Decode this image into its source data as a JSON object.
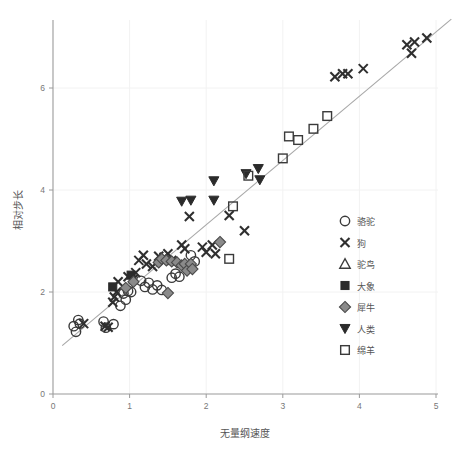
{
  "chart_data": {
    "type": "scatter",
    "title": "",
    "xlabel": "无量纲速度",
    "ylabel": "相对步长",
    "xlim": [
      -0.05,
      5.3
    ],
    "ylim": [
      0,
      7.4
    ],
    "xticks": [
      0,
      1,
      2,
      3,
      4,
      5
    ],
    "yticks": [
      0,
      2,
      4,
      6
    ],
    "xtick_labels": [
      "0",
      "1",
      "2",
      "3",
      "4",
      "5"
    ],
    "ytick_labels": [
      "0",
      "2",
      "4",
      "6"
    ],
    "grid": true,
    "legend_position": "right-center",
    "trendline": {
      "name": "拟合直线",
      "x": [
        0.12,
        5.2
      ],
      "y": [
        0.95,
        7.35
      ]
    },
    "series": [
      {
        "name": "骆驼",
        "marker": "circle-open",
        "color": "#3a3a3a",
        "points": [
          [
            0.27,
            1.33
          ],
          [
            0.3,
            1.22
          ],
          [
            0.33,
            1.45
          ],
          [
            0.35,
            1.38
          ],
          [
            0.66,
            1.42
          ],
          [
            0.69,
            1.3
          ],
          [
            0.79,
            1.37
          ],
          [
            0.88,
            1.73
          ],
          [
            0.92,
            1.97
          ],
          [
            0.95,
            1.85
          ],
          [
            0.98,
            2.02
          ],
          [
            1.02,
            2.0
          ],
          [
            1.15,
            2.22
          ],
          [
            1.2,
            2.1
          ],
          [
            1.25,
            2.18
          ],
          [
            1.3,
            2.05
          ],
          [
            1.36,
            2.13
          ],
          [
            1.42,
            2.04
          ],
          [
            1.55,
            2.28
          ],
          [
            1.6,
            2.36
          ],
          [
            1.65,
            2.3
          ],
          [
            1.8,
            2.72
          ],
          [
            1.85,
            2.6
          ]
        ]
      },
      {
        "name": "狗",
        "marker": "cross",
        "color": "#2f2f2f",
        "points": [
          [
            0.4,
            1.38
          ],
          [
            0.68,
            1.33
          ],
          [
            0.72,
            1.31
          ],
          [
            0.78,
            1.8
          ],
          [
            0.8,
            1.9
          ],
          [
            0.83,
            2.0
          ],
          [
            0.85,
            2.2
          ],
          [
            0.98,
            2.3
          ],
          [
            1.05,
            2.25
          ],
          [
            1.08,
            2.38
          ],
          [
            1.12,
            2.62
          ],
          [
            1.18,
            2.72
          ],
          [
            1.22,
            2.55
          ],
          [
            1.3,
            2.5
          ],
          [
            1.38,
            2.7
          ],
          [
            1.45,
            2.68
          ],
          [
            1.5,
            2.75
          ],
          [
            1.55,
            2.62
          ],
          [
            1.68,
            2.92
          ],
          [
            1.72,
            2.85
          ],
          [
            1.78,
            3.48
          ],
          [
            1.95,
            2.88
          ],
          [
            2.0,
            2.78
          ],
          [
            2.08,
            2.92
          ],
          [
            2.12,
            2.75
          ],
          [
            2.3,
            3.5
          ],
          [
            2.5,
            3.2
          ],
          [
            3.68,
            6.22
          ],
          [
            3.78,
            6.28
          ],
          [
            3.85,
            6.28
          ],
          [
            4.05,
            6.38
          ],
          [
            4.62,
            6.85
          ],
          [
            4.68,
            6.68
          ],
          [
            4.72,
            6.9
          ],
          [
            4.88,
            6.98
          ]
        ]
      },
      {
        "name": "驼鸟",
        "marker": "triangle-open",
        "color": "#3a3a3a",
        "points": []
      },
      {
        "name": "大象",
        "marker": "square-filled",
        "color": "#2b2b2b",
        "points": [
          [
            0.78,
            2.1
          ],
          [
            1.02,
            2.33
          ]
        ]
      },
      {
        "name": "犀牛",
        "marker": "diamond-filled",
        "color": "#8a8a8a",
        "points": [
          [
            0.95,
            2.08
          ],
          [
            1.05,
            2.2
          ],
          [
            1.38,
            2.58
          ],
          [
            1.42,
            2.65
          ],
          [
            1.48,
            2.62
          ],
          [
            1.5,
            1.98
          ],
          [
            1.55,
            2.6
          ],
          [
            1.62,
            2.58
          ],
          [
            1.68,
            2.52
          ],
          [
            1.72,
            2.55
          ],
          [
            1.75,
            2.42
          ],
          [
            1.8,
            2.55
          ],
          [
            1.82,
            2.45
          ],
          [
            2.18,
            2.98
          ]
        ]
      },
      {
        "name": "人类",
        "marker": "triangle-down-filled",
        "color": "#2b2b2b",
        "points": [
          [
            1.68,
            3.78
          ],
          [
            1.8,
            3.8
          ],
          [
            2.1,
            4.18
          ],
          [
            2.1,
            3.8
          ],
          [
            2.52,
            4.32
          ],
          [
            2.68,
            4.42
          ],
          [
            2.7,
            4.2
          ]
        ]
      },
      {
        "name": "绵羊",
        "marker": "square-open",
        "color": "#3a3a3a",
        "points": [
          [
            2.3,
            2.65
          ],
          [
            2.35,
            3.68
          ],
          [
            2.55,
            4.28
          ],
          [
            3.0,
            4.62
          ],
          [
            3.08,
            5.05
          ],
          [
            3.2,
            4.98
          ],
          [
            3.4,
            5.2
          ],
          [
            3.58,
            5.45
          ]
        ]
      }
    ]
  },
  "legend": {
    "items": [
      {
        "label": "骆驼",
        "marker": "circle-open"
      },
      {
        "label": "狗",
        "marker": "cross"
      },
      {
        "label": "驼鸟",
        "marker": "triangle-open"
      },
      {
        "label": "大象",
        "marker": "square-filled"
      },
      {
        "label": "犀牛",
        "marker": "diamond-filled"
      },
      {
        "label": "人类",
        "marker": "triangle-down-filled"
      },
      {
        "label": "绵羊",
        "marker": "square-open"
      }
    ]
  },
  "icons": {
    "circle_open": "circle-open-marker-icon",
    "cross": "cross-marker-icon",
    "triangle_open": "triangle-open-marker-icon",
    "square_filled": "square-filled-marker-icon",
    "diamond_filled": "diamond-filled-marker-icon",
    "triangle_down_filled": "triangle-down-filled-marker-icon",
    "square_open": "square-open-marker-icon"
  }
}
